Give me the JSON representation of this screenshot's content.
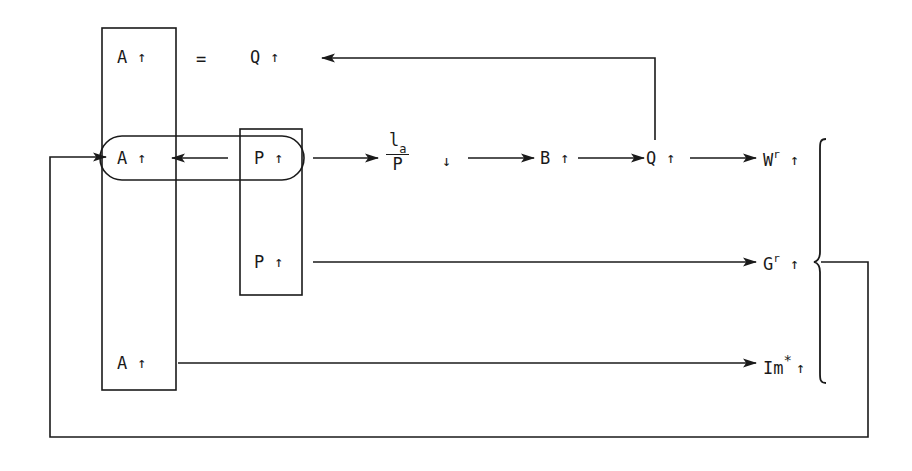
{
  "diagram": {
    "stroke_color": "#1a1a1a",
    "background_color": "#ffffff",
    "arrow_up": "↑",
    "arrow_down": "↓",
    "equals_sign": "=",
    "boxes": {
      "a_column_label": "A-column box",
      "p_column_label": "P-column box",
      "stadium_label": "A-to-P stadium"
    },
    "nodes": [
      {
        "id": "a-top",
        "symbol": "A",
        "direction": "↑",
        "row": "top"
      },
      {
        "id": "q-top",
        "symbol": "Q",
        "direction": "↑",
        "row": "top"
      },
      {
        "id": "a-middle",
        "symbol": "A",
        "direction": "↑",
        "row": "middle"
      },
      {
        "id": "p-middle",
        "symbol": "P",
        "direction": "↑",
        "row": "middle"
      },
      {
        "id": "b-middle",
        "symbol": "B",
        "direction": "↑",
        "row": "middle"
      },
      {
        "id": "q-middle",
        "symbol": "Q",
        "direction": "↑",
        "row": "middle"
      },
      {
        "id": "p-lower",
        "symbol": "P",
        "direction": "↑",
        "row": "lower"
      },
      {
        "id": "a-bottom",
        "symbol": "A",
        "direction": "↑",
        "row": "bottom"
      }
    ],
    "fraction": {
      "numerator_base": "l",
      "numerator_sub": "a",
      "denominator": "P",
      "direction": "↓"
    },
    "outputs": [
      {
        "id": "w-r",
        "base": "W",
        "superscript": "r",
        "direction": "↑"
      },
      {
        "id": "g-r",
        "base": "G",
        "superscript": "r",
        "direction": "↑"
      },
      {
        "id": "im-star",
        "base": "Im",
        "superscript": "*",
        "direction": "↑"
      }
    ]
  }
}
